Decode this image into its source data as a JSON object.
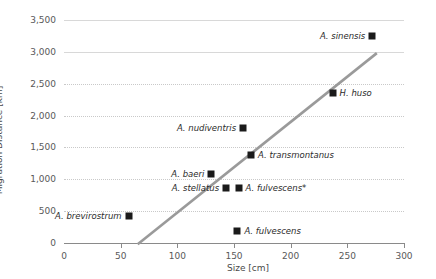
{
  "chart_data": {
    "type": "scatter",
    "title": "",
    "xlabel": "Size [cm]",
    "ylabel": "Migration Distance [km]",
    "xlim": [
      0,
      300
    ],
    "ylim": [
      0,
      3500
    ],
    "xticks": [
      0,
      50,
      100,
      150,
      200,
      250,
      300
    ],
    "xtick_labels": [
      "0",
      "50",
      "100",
      "150",
      "200",
      "250",
      "300"
    ],
    "yticks": [
      0,
      500,
      1000,
      1500,
      2000,
      2500,
      3000,
      3500
    ],
    "ytick_labels": [
      "0",
      "500",
      "1,000",
      "1,500",
      "2,000",
      "2,500",
      "3,000",
      "3,500"
    ],
    "grid": true,
    "legend": "none",
    "marker_color": "#1a1a1a",
    "trendline_color": "#9a9a9a",
    "points": [
      {
        "label": "A. sinensis",
        "x": 272,
        "y": 3250,
        "label_side": "left"
      },
      {
        "label": "H. huso",
        "x": 237,
        "y": 2360,
        "label_side": "right"
      },
      {
        "label": "A. nudiventris",
        "x": 158,
        "y": 1810,
        "label_side": "left"
      },
      {
        "label": "A. transmontanus",
        "x": 165,
        "y": 1380,
        "label_side": "right"
      },
      {
        "label": "A. baeri",
        "x": 130,
        "y": 1090,
        "label_side": "left"
      },
      {
        "label": "A. stellatus",
        "x": 143,
        "y": 870,
        "label_side": "left"
      },
      {
        "label": "A. fulvescens*",
        "x": 154,
        "y": 870,
        "label_side": "right"
      },
      {
        "label": "A. fulvescens",
        "x": 153,
        "y": 185,
        "label_side": "right"
      },
      {
        "label": "A. brevirostrum",
        "x": 57,
        "y": 420,
        "label_side": "left"
      }
    ],
    "trendline": {
      "x0": 65,
      "y0": -20,
      "x1": 276,
      "y1": 2980
    }
  }
}
